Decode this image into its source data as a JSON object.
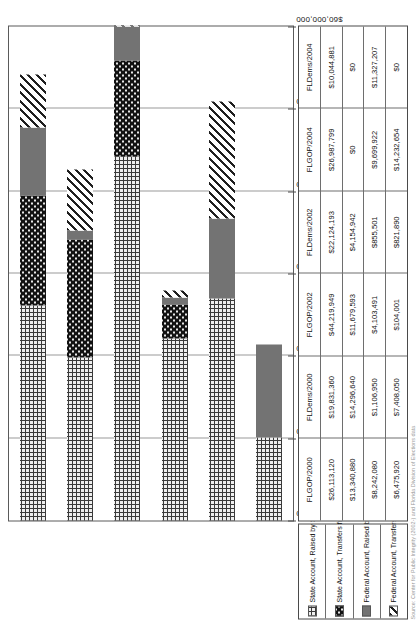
{
  "chart_data": {
    "type": "bar",
    "orientation": "horizontal-stacked",
    "title": "",
    "xlabel": "",
    "ylabel": "",
    "grid": true,
    "legend_position": "bottom-left-table",
    "xlim": [
      0,
      60000000
    ],
    "tick_labels": [
      "$60,000,000",
      "$50,000,000",
      "$40,000,000",
      "$30,000,000",
      "$20,000,000",
      "$10,000,000",
      "$0"
    ],
    "tick_values": [
      60000000,
      50000000,
      40000000,
      30000000,
      20000000,
      10000000,
      0
    ],
    "categories": [
      "FLGOP/2000",
      "FLDems/2000",
      "FLGOP/2002",
      "FLDems/2002",
      "FLGOP/2004",
      "FLDems/2004"
    ],
    "series": [
      {
        "name": "State Account, Raised by State Party",
        "pattern": "crosshatch",
        "values": [
          26113120,
          19831360,
          44219949,
          22124193,
          26987799,
          10044881
        ],
        "labels": [
          "$26,113,120",
          "$19,831,360",
          "$44,219,949",
          "$22,124,193",
          "$26,987,799",
          "$10,044,881"
        ]
      },
      {
        "name": "State Account, Transfers from National Parties",
        "pattern": "black-dot",
        "values": [
          13340880,
          14296640,
          11679593,
          4154942,
          0,
          0
        ],
        "labels": [
          "$13,340,880",
          "$14,296,640",
          "$11,679,593",
          "$4,154,942",
          "$0",
          "$0"
        ]
      },
      {
        "name": "Federal Account, Raised by State Party",
        "pattern": "solid-gray",
        "values": [
          8242080,
          1106950,
          4103491,
          855501,
          9699922,
          11327207
        ],
        "labels": [
          "$8,242,080",
          "$1,106,950",
          "$4,103,491",
          "$855,501",
          "$9,699,922",
          "$11,327,207"
        ]
      },
      {
        "name": "Federal Account, Transfers from National Parties",
        "pattern": "diagonal-stripes",
        "values": [
          6475920,
          7408050,
          104001,
          821890,
          14232654,
          0
        ],
        "labels": [
          "$6,475,920",
          "$7,408,050",
          "$104,001",
          "$821,890",
          "$14,232,654",
          "$0"
        ]
      }
    ]
  },
  "legend": {
    "items": [
      {
        "label": "State Account, Raised by State Party",
        "pattern": "crosshatch"
      },
      {
        "label": "State Account, Transfers from National Parties",
        "pattern": "black-dot"
      },
      {
        "label": "Federal Account, Raised by State Party",
        "pattern": "solid-gray"
      },
      {
        "label": "Federal Account, Transfers from National Parties",
        "pattern": "diagonal-stripes"
      }
    ]
  },
  "caption": "Source: Center for Public Integrity (2002-) and Florida Division of Elections data",
  "colors": {
    "crosshatch_line": "#3a3a3a",
    "crosshatch_bg": "#efefef",
    "black_dot": "#121212",
    "solid_gray": "#737373",
    "diag_stripe": "#1f1f1f",
    "grid": "#9a9a9a",
    "axis": "#5a5a5a"
  }
}
